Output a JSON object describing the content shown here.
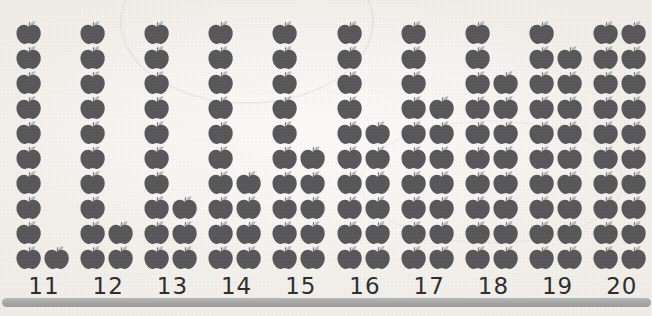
{
  "worksheet": {
    "title": "Apple tens-and-ones counting chart",
    "background_color": "#f2f0ec",
    "apple_color": "#58585a",
    "stem_color": "#6e6e70",
    "leaf_color": "#b9b9bb",
    "baseline_color": "#a9a9a9",
    "label_color": "#2f2f30"
  },
  "chart_data": {
    "type": "bar",
    "xlabel": "",
    "ylabel": "",
    "categories": [
      "11",
      "12",
      "13",
      "14",
      "15",
      "16",
      "17",
      "18",
      "19",
      "20"
    ],
    "values": [
      11,
      12,
      13,
      14,
      15,
      16,
      17,
      18,
      19,
      20
    ],
    "unit_icon": "apple-icon",
    "column_capacity": 10,
    "grid": false,
    "legend": false,
    "groups": [
      {
        "label": "11",
        "total": 11,
        "left_column": 10,
        "right_column": 1
      },
      {
        "label": "12",
        "total": 12,
        "left_column": 10,
        "right_column": 2
      },
      {
        "label": "13",
        "total": 13,
        "left_column": 10,
        "right_column": 3
      },
      {
        "label": "14",
        "total": 14,
        "left_column": 10,
        "right_column": 4
      },
      {
        "label": "15",
        "total": 15,
        "left_column": 10,
        "right_column": 5
      },
      {
        "label": "16",
        "total": 16,
        "left_column": 10,
        "right_column": 6
      },
      {
        "label": "17",
        "total": 17,
        "left_column": 10,
        "right_column": 7
      },
      {
        "label": "18",
        "total": 18,
        "left_column": 10,
        "right_column": 8
      },
      {
        "label": "19",
        "total": 19,
        "left_column": 10,
        "right_column": 9
      },
      {
        "label": "20",
        "total": 20,
        "left_column": 10,
        "right_column": 10
      }
    ]
  },
  "baseline": {
    "name": "baseline-rule"
  }
}
